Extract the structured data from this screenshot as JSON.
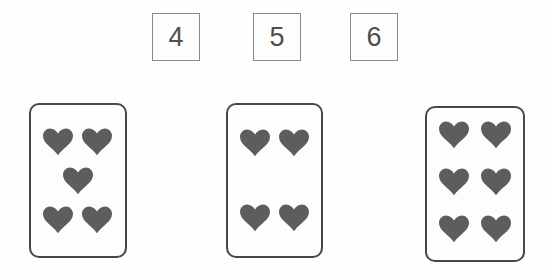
{
  "number_boxes": [
    {
      "label": "4"
    },
    {
      "label": "5"
    },
    {
      "label": "6"
    }
  ],
  "cards": [
    {
      "id": "card-5-hearts",
      "symbol": "heart",
      "heart_count": 5,
      "rows": [
        2,
        1,
        2
      ]
    },
    {
      "id": "card-4-hearts",
      "symbol": "heart",
      "heart_count": 4,
      "rows": [
        2,
        2
      ]
    },
    {
      "id": "card-6-hearts",
      "symbol": "heart",
      "heart_count": 6,
      "rows": [
        2,
        2,
        2
      ]
    }
  ],
  "colors": {
    "heart_fill": "#5d5d5d",
    "card_border": "#474747",
    "box_border": "#8a8a8a",
    "number_text": "#4f4f4f",
    "background": "#fefefe"
  }
}
